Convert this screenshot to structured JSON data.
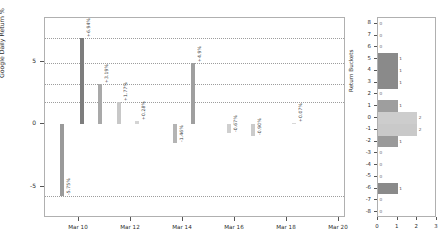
{
  "chart_data": [
    {
      "type": "bar",
      "id": "daily-returns",
      "title": "",
      "xlabel": "",
      "ylabel": "Google Daily Return %",
      "ylim": [
        -7.5,
        8.5
      ],
      "yticks": [
        5,
        0,
        -5
      ],
      "ytick_labels": [
        "5",
        "0",
        "-5"
      ],
      "xtick_labels": [
        "Mar 10",
        "Mar 12",
        "Mar 14",
        "Mar 16",
        "Mar 18",
        "Mar 20"
      ],
      "xtick_x": [
        78,
        130,
        182,
        234,
        286,
        338
      ],
      "grid": true,
      "gridlines": [
        6.94,
        3.19,
        1.77,
        -5.75,
        4.9
      ],
      "categories": [
        "Mar 9",
        "Mar 10",
        "Mar 11",
        "Mar 12",
        "Mar 13",
        "Mar 16",
        "Mar 17",
        "Mar 18",
        "Mar 19",
        "Mar 20"
      ],
      "values": [
        -5.75,
        6.94,
        3.19,
        1.77,
        0.28,
        -1.46,
        4.9,
        -0.67,
        -0.9,
        0.07
      ],
      "point_labels": [
        "-5.75%",
        "+6.94%",
        "+3.19%",
        "+1.77%",
        "+0.28%",
        "-1.46%",
        "+4.9%",
        "-0.67%",
        "-0.90%",
        "+0.07%"
      ],
      "bar_x": [
        59,
        79,
        97,
        116,
        134,
        172,
        190,
        226,
        250,
        291
      ],
      "bar_colors": [
        "#9a9a9a",
        "#7d7d7d",
        "#a9a9a9",
        "#c8c8c8",
        "#d4d4d4",
        "#b4b4b4",
        "#9f9f9f",
        "#cfcfcf",
        "#cbcbcb",
        "#d8d8d8"
      ]
    },
    {
      "type": "bar",
      "id": "return-buckets",
      "orientation": "horizontal",
      "title": "",
      "xlabel": "",
      "ylabel": "Return Buckets",
      "xlim": [
        0,
        3
      ],
      "ylim": [
        -8.5,
        8.5
      ],
      "xticks": [
        0,
        1,
        2,
        3
      ],
      "xtick_labels": [
        "0",
        "1",
        "2",
        "3"
      ],
      "ytick_labels": [
        "8",
        "7",
        "6",
        "5",
        "4",
        "3",
        "2",
        "1",
        "0",
        "-1",
        "-2",
        "-3",
        "-4",
        "-5",
        "-6",
        "-7",
        "-8"
      ],
      "buckets": [
        8,
        7,
        6,
        5,
        4,
        3,
        2,
        1,
        0,
        -1,
        -2,
        -3,
        -4,
        -5,
        -6,
        -7,
        -8
      ],
      "counts": [
        0,
        0,
        0,
        1,
        1,
        1,
        0,
        1,
        2,
        2,
        1,
        0,
        0,
        0,
        1,
        0,
        0
      ],
      "bar_colors": [
        "#8a8a8a",
        "#8a8a8a",
        "#8a8a8a",
        "#8a8a8a",
        "#8a8a8a",
        "#8a8a8a",
        "#8a8a8a",
        "#9e9e9e",
        "#cdcdcd",
        "#c9c9c9",
        "#9a9a9a",
        "#8a8a8a",
        "#8a8a8a",
        "#8a8a8a",
        "#8a8a8a",
        "#8a8a8a",
        "#8a8a8a"
      ]
    }
  ],
  "colors": {
    "axis": "#b0b0b0",
    "text": "#2b2b2b",
    "grid": "#8c8c8c",
    "background": "#ffffff"
  }
}
